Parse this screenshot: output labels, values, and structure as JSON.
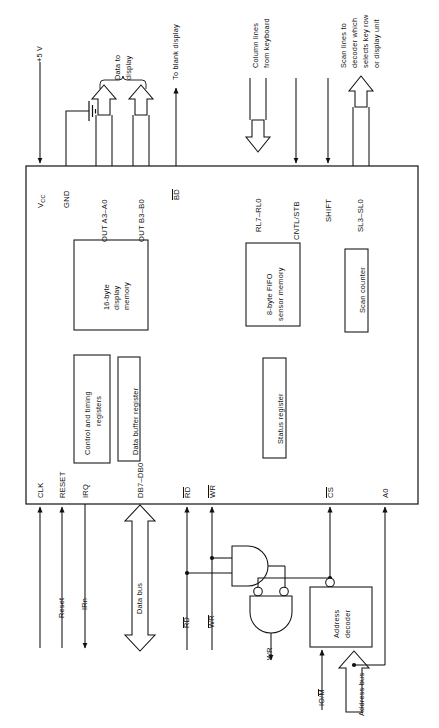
{
  "figure": {
    "kind": "block-diagram",
    "orientation": "rotated-90-ccw"
  },
  "chip": {
    "name": "8279-chip-body"
  },
  "top_pins": [
    {
      "id": "vcc",
      "label": "V",
      "sub": "CC",
      "kind": "line-arrow-in",
      "x": 40
    },
    {
      "id": "gnd",
      "label": "GND",
      "sub": "",
      "kind": "line-ground",
      "x": 66
    },
    {
      "id": "out_a",
      "label": "OUT A3–A0",
      "sub": "",
      "kind": "block-arrow-out",
      "x": 104
    },
    {
      "id": "out_b",
      "label": "OUT B3–B0",
      "sub": "",
      "kind": "block-arrow-out",
      "x": 141
    },
    {
      "id": "bd",
      "label": "BD",
      "sub": "",
      "kind": "line-arrow-out",
      "x": 176,
      "overline": true
    },
    {
      "id": "rl",
      "label": "RL7–RL0",
      "sub": "",
      "kind": "block-arrow-in",
      "x": 258
    },
    {
      "id": "cntl",
      "label": "CNTL/STB",
      "sub": "",
      "kind": "line-arrow-in",
      "x": 296
    },
    {
      "id": "shift",
      "label": "SHIFT",
      "sub": "",
      "kind": "line-arrow-in",
      "x": 328
    },
    {
      "id": "sl",
      "label": "SL3–SL0",
      "sub": "",
      "kind": "block-arrow-out",
      "x": 360
    }
  ],
  "top_annotations": [
    {
      "id": "plus5v",
      "text": "+5 V",
      "x": 40,
      "y": 48
    },
    {
      "id": "data-to-disp",
      "text": "Data to\ndisplay",
      "x": 122,
      "y": 50
    },
    {
      "id": "to-blank",
      "text": "To blank display",
      "x": 176,
      "y": 18
    },
    {
      "id": "column-lines",
      "text": "Column lines\nfrom keyboard",
      "x": 262,
      "y": 18
    },
    {
      "id": "scan-lines",
      "text": "Scan lines to\ndecoder which\nselects key row\nor display unit",
      "x": 364,
      "y": 18
    }
  ],
  "bottom_pins": [
    {
      "id": "clk",
      "label": "CLK",
      "kind": "line-arrow-in",
      "x": 40
    },
    {
      "id": "reset",
      "label": "RESET",
      "kind": "line-arrow-in",
      "x": 62
    },
    {
      "id": "irq",
      "label": "IRQ",
      "kind": "line-arrow-out",
      "x": 85
    },
    {
      "id": "db",
      "label": "DB7–DB0",
      "kind": "block-arrow-bidir",
      "x": 140
    },
    {
      "id": "rd",
      "label": "RD",
      "kind": "line-arrow-in",
      "x": 187,
      "overline": true
    },
    {
      "id": "wr",
      "label": "WR",
      "kind": "line-arrow-in",
      "x": 212,
      "overline": true
    },
    {
      "id": "cs",
      "label": "CS",
      "kind": "line-arrow-in",
      "x": 330,
      "overline": true
    },
    {
      "id": "a0",
      "label": "A0",
      "kind": "line-arrow-in",
      "x": 385
    }
  ],
  "bottom_annotations": [
    {
      "id": "reset-sig",
      "text": "Reset",
      "x": 62,
      "y": 590
    },
    {
      "id": "irn-sig",
      "text": "IRn",
      "x": 85,
      "y": 590
    },
    {
      "id": "data-bus",
      "text": "Data bus",
      "x": 140,
      "y": 590
    },
    {
      "id": "rd-sig",
      "text": "RD",
      "x": 187,
      "y": 600,
      "overline": true
    },
    {
      "id": "wr-sig",
      "text": "WR",
      "x": 212,
      "y": 600,
      "overline": true
    },
    {
      "id": "ready-sig",
      "text": "Ready",
      "x": 262,
      "y": 605
    },
    {
      "id": "iom-sig",
      "text": "IO/M",
      "x": 322,
      "y": 672,
      "partial_overline": "M"
    },
    {
      "id": "addr-bus",
      "text": "Address bus",
      "x": 352,
      "y": 660
    }
  ],
  "internal_blocks": [
    {
      "id": "ctrl-timing",
      "label": "Control and timing\nregisters",
      "x": 74,
      "y": 355,
      "w": 36,
      "h": 108
    },
    {
      "id": "disp-mem",
      "label": "16-byte\ndisplay\nmemory",
      "x": 74,
      "y": 240,
      "w": 74,
      "h": 90
    },
    {
      "id": "data-buf",
      "label": "Data buffer register",
      "x": 118,
      "y": 357,
      "w": 22,
      "h": 104
    },
    {
      "id": "fifo",
      "label": "8-byte FIFO\nsensor memory",
      "x": 246,
      "y": 243,
      "w": 54,
      "h": 83
    },
    {
      "id": "status-reg",
      "label": "Status register",
      "x": 263,
      "y": 358,
      "w": 23,
      "h": 100
    },
    {
      "id": "scan-ctr",
      "label": "Scan counter",
      "x": 345,
      "y": 249,
      "w": 23,
      "h": 83
    }
  ],
  "external_logic": [
    {
      "id": "and-gate",
      "label": "AND gate",
      "type": "and"
    },
    {
      "id": "nand-gate",
      "label": "NAND gate",
      "type": "nand-inverted-inputs"
    },
    {
      "id": "addr-decoder",
      "label": "Address\ndecoder",
      "type": "block",
      "x": 310,
      "y": 587,
      "w": 62,
      "h": 60
    }
  ],
  "colors": {
    "stroke": "#111111",
    "background": "#ffffff",
    "text": "#111111"
  }
}
